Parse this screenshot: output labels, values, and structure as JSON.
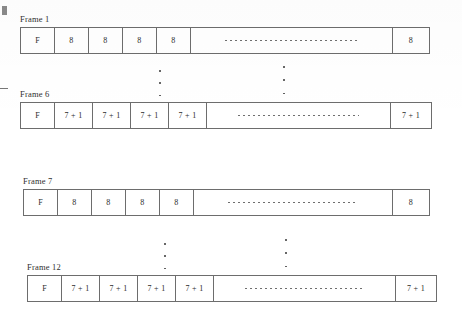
{
  "diagram": {
    "type": "frame-structure-diagram",
    "rows": [
      {
        "label": "Frame 1",
        "first_cell": "F",
        "unit_cells": [
          "8",
          "8",
          "8",
          "8"
        ],
        "gap": "",
        "tail_cell": "8"
      },
      {
        "label": "Frame 6",
        "first_cell": "F",
        "unit_cells": [
          "7 + 1",
          "7 + 1",
          "7 + 1",
          "7 + 1"
        ],
        "gap": "",
        "tail_cell": "7 + 1"
      },
      {
        "label": "Frame 7",
        "first_cell": "F",
        "unit_cells": [
          "8",
          "8",
          "8",
          "8"
        ],
        "gap": "",
        "tail_cell": "8"
      },
      {
        "label": "Frame 12",
        "first_cell": "F",
        "unit_cells": [
          "7 + 1",
          "7 + 1",
          "7 + 1",
          "7 + 1"
        ],
        "gap": "",
        "tail_cell": "7 + 1"
      }
    ],
    "ellipsis": {
      "vertical_dot_count": 3,
      "horizontal_dots_label": ""
    },
    "colors": {
      "line": "#6d6d6d",
      "text": "#2b2b2b",
      "background": "#ffffff"
    }
  }
}
